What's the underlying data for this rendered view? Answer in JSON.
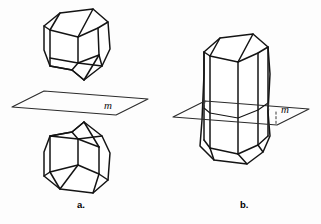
{
  "figure": {
    "background_color": "#fdfdfd",
    "line_color": "#141414",
    "panels": [
      {
        "id": "a",
        "caption": "a.",
        "plane_label": "m",
        "description": "Two congruent polyhedra reflected across a horizontal plane m",
        "plane_label_position": {
          "x": 108,
          "y": 108
        },
        "caption_position": {
          "x": 77,
          "y": 206
        }
      },
      {
        "id": "b",
        "caption": "b.",
        "plane_label": "m",
        "description": "A single prism intersected by a horizontal plane of symmetry m",
        "plane_label_position": {
          "x": 283,
          "y": 112
        },
        "caption_position": {
          "x": 240,
          "y": 206
        }
      }
    ]
  },
  "labels": {
    "panel_a_caption": "a.",
    "panel_b_caption": "b.",
    "plane_a": "m",
    "plane_b": "m"
  }
}
